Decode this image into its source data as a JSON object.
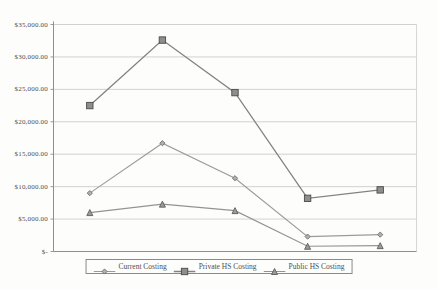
{
  "chart_data": {
    "type": "line",
    "title": "",
    "xlabel": "",
    "ylabel": "",
    "x": [
      1,
      2,
      3,
      4,
      5
    ],
    "x_axis_labels_visible": false,
    "series": [
      {
        "name": "Current Costing",
        "marker": "diamond",
        "values": [
          9000,
          16700,
          11300,
          2300,
          2600
        ],
        "line_color": "#9b9b9b",
        "marker_fill": "#b0b0b0",
        "marker_stroke": "#6e6e6e",
        "line_width": 1.1
      },
      {
        "name": "Private HS Costing",
        "marker": "square",
        "values": [
          22500,
          32600,
          24500,
          8200,
          9500
        ],
        "line_color": "#828282",
        "marker_fill": "#8e8e8e",
        "marker_stroke": "#4a4a4a",
        "line_width": 1.3
      },
      {
        "name": "Public HS Costing",
        "marker": "triangle",
        "values": [
          6000,
          7300,
          6300,
          800,
          900
        ],
        "line_color": "#939393",
        "marker_fill": "#9b9b9b",
        "marker_stroke": "#5c5c5c",
        "line_width": 1.1
      }
    ],
    "ylim": [
      0,
      35000
    ],
    "ytick_step": 5000,
    "ytick_labels": [
      "$-",
      "$5,000.00",
      "$10,000.00",
      "$15,000.00",
      "$20,000.00",
      "$25,000.00",
      "$30,000.00",
      "$35,000.00"
    ],
    "grid": true,
    "legend_position": "bottom-center",
    "colors": {
      "gridline": "#c7c7c7",
      "axis": "#8f8f8f",
      "plot_right_border": "#d2d2d2",
      "text": "#4f4f4f",
      "legend_border": "#8a8a8a"
    }
  }
}
